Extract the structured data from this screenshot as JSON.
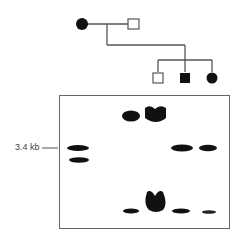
{
  "pedigree": {
    "generation_1": [
      {
        "id": "mother",
        "sex": "female",
        "affected": true
      },
      {
        "id": "father",
        "sex": "male",
        "affected": false
      }
    ],
    "generation_2": [
      {
        "id": "son-1",
        "sex": "male",
        "affected": false
      },
      {
        "id": "son-2",
        "sex": "male",
        "affected": true
      },
      {
        "id": "daughter",
        "sex": "female",
        "affected": true
      }
    ]
  },
  "gel": {
    "marker_label": "3.4 kb",
    "lanes": [
      {
        "lane": 1,
        "bands": [
          "3.4 kb",
          "below 3.4 kb"
        ]
      },
      {
        "lane": 2,
        "bands": [
          "top",
          "bottom"
        ]
      },
      {
        "lane": 3,
        "bands": [
          "top (intense)",
          "bottom (intense)"
        ]
      },
      {
        "lane": 4,
        "bands": [
          "3.4 kb",
          "bottom"
        ]
      },
      {
        "lane": 5,
        "bands": [
          "3.4 kb",
          "bottom (faint)"
        ]
      }
    ]
  },
  "colors": {
    "ink": "#111111",
    "line": "#555555",
    "frame": "#666666"
  }
}
